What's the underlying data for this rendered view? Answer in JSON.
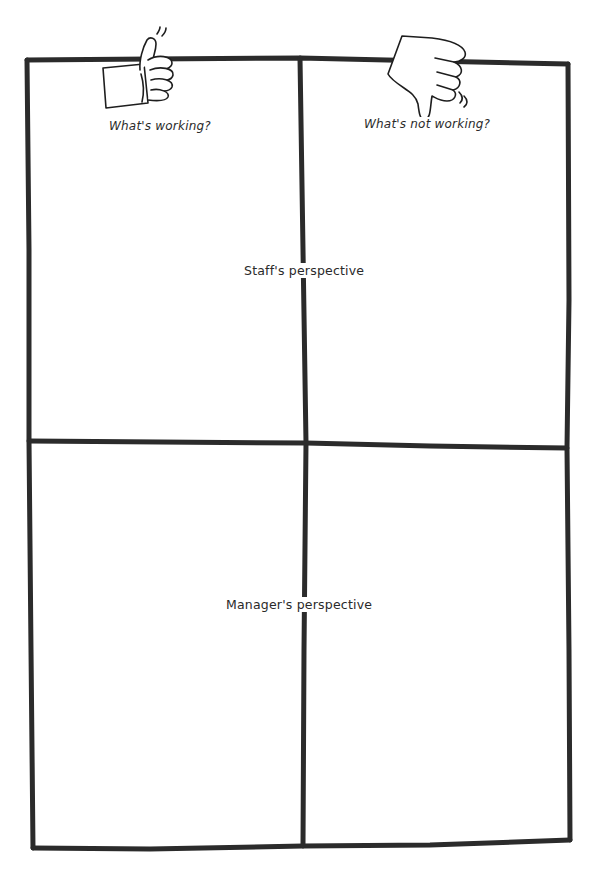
{
  "diagram": {
    "type": "2x2 matrix",
    "columns": [
      {
        "label": "What's working?",
        "icon": "thumbs-up-icon"
      },
      {
        "label": "What's not working?",
        "icon": "thumbs-down-icon"
      }
    ],
    "rows": [
      {
        "label": "Staff's perspective"
      },
      {
        "label": "Manager's perspective"
      }
    ],
    "quadrants": [
      {
        "row": "Staff's perspective",
        "column": "What's working?",
        "content": ""
      },
      {
        "row": "Staff's perspective",
        "column": "What's not working?",
        "content": ""
      },
      {
        "row": "Manager's perspective",
        "column": "What's working?",
        "content": ""
      },
      {
        "row": "Manager's perspective",
        "column": "What's not working?",
        "content": ""
      }
    ],
    "colors": {
      "line": "#2b2b2b",
      "background": "#ffffff",
      "text": "#2a2a2a"
    }
  }
}
